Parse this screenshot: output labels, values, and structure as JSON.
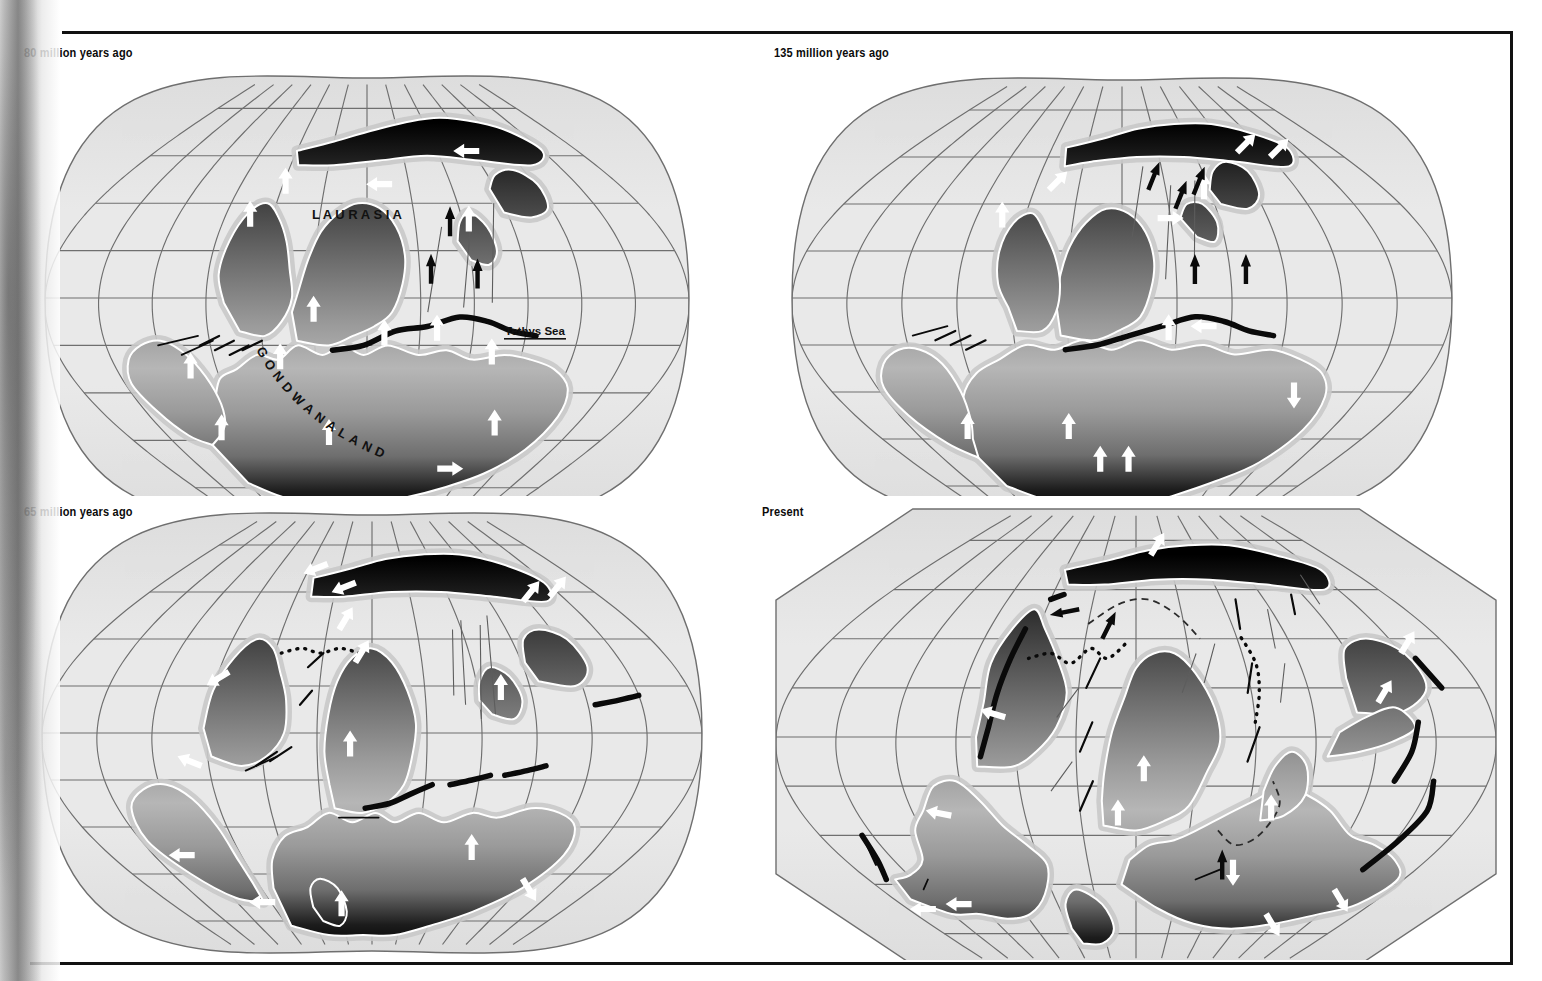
{
  "figure": {
    "kind": "continental-drift-map-series",
    "projection": "oval-pseudocylindrical",
    "panel_count": 4,
    "background": "#ffffff",
    "frame_color": "#111111"
  },
  "colors": {
    "ocean": "#e9e9e9",
    "ocean_deep": "#dcdcdc",
    "shelf": "#c9c9c9",
    "graticule": "#6f6f6f",
    "land_dark": "#000000",
    "land_mid": "#6e6e6e",
    "land_light": "#b6b6b6",
    "coast_outline": "#ffffff",
    "tectonic_black": "#0a0a0a",
    "arrow_white": "#ffffff",
    "arrow_black": "#0a0a0a",
    "label_text": "#0b0b0b"
  },
  "panels": [
    {
      "id": "panel-80ma",
      "label": "80 million years ago",
      "position": {
        "x": 22,
        "y": 46,
        "w": 690,
        "h": 450
      },
      "map": {
        "cx": 345,
        "cy": 252,
        "rx": 322,
        "ry": 220,
        "shape": "oval"
      },
      "graticule": {
        "meridian_count": 13,
        "parallel_count": 9
      },
      "place_labels": [
        {
          "name": "laurasia-label",
          "text": "L A U R A S I A",
          "x": 290,
          "y": 173,
          "size": 13,
          "rotate": 0,
          "color": "#111111"
        },
        {
          "name": "gondwanaland-label",
          "text": "GONDWANALAND",
          "x": 232,
          "y": 300,
          "size": 13,
          "arc": true,
          "color": "#111111"
        },
        {
          "name": "tethys-sea-label",
          "text": "Tethys Sea",
          "x": 483,
          "y": 289,
          "size": 11.5,
          "underline": true,
          "color": "#111111"
        }
      ]
    },
    {
      "id": "panel-135ma",
      "label": "135 million years ago",
      "position": {
        "x": 772,
        "y": 46,
        "w": 700,
        "h": 450
      },
      "map": {
        "cx": 350,
        "cy": 252,
        "rx": 330,
        "ry": 218,
        "shape": "oval"
      },
      "graticule": {
        "meridian_count": 13,
        "parallel_count": 9
      },
      "place_labels": []
    },
    {
      "id": "panel-65ma",
      "label": "65 million years ago",
      "position": {
        "x": 22,
        "y": 505,
        "w": 700,
        "h": 455
      },
      "map": {
        "cx": 350,
        "cy": 228,
        "rx": 330,
        "ry": 218,
        "shape": "oval"
      },
      "graticule": {
        "meridian_count": 13,
        "parallel_count": 9
      },
      "place_labels": []
    },
    {
      "id": "panel-present",
      "label": "Present",
      "position": {
        "x": 760,
        "y": 505,
        "w": 752,
        "h": 455
      },
      "map": {
        "cx": 376,
        "cy": 232,
        "rx": 360,
        "ry": 228,
        "shape": "rounded-octagon"
      },
      "graticule": {
        "meridian_count": 13,
        "parallel_count": 9
      },
      "place_labels": []
    }
  ],
  "legend_semantics": {
    "white_arrow": "plate motion direction (on continental crust)",
    "black_arrow": "plate motion direction (oceanic)",
    "thick_black_curve": "subduction zone / trench",
    "short_black_line": "transform fault",
    "dashed_black_curve": "inferred plate boundary",
    "gradient_land": "continental landmass, shaded dark toward the poles"
  }
}
